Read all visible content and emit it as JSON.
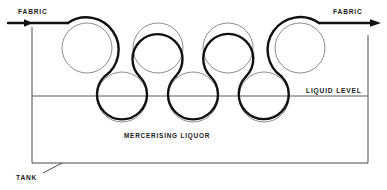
{
  "diagram": {
    "type": "process-schematic",
    "canvas": {
      "width": 387,
      "height": 190,
      "background": "#ffffff"
    },
    "colors": {
      "fabric_path": "#111111",
      "roller_outline": "#8d8d8d",
      "tank_outline": "#4a4a4a",
      "liquid_level": "#5a5a5a",
      "text": "#1a1a1a"
    },
    "labels": {
      "fabric_in": "FABRIC",
      "fabric_out": "FABRIC",
      "liquid_level": "LIQUID  LEVEL",
      "liquor": "MERCERISING   LIQUOR",
      "tank": "TANK"
    },
    "tank": {
      "left": 32,
      "right": 368,
      "top_left_y": 27,
      "top_right_y": 35,
      "bottom": 163
    },
    "liquid_level": {
      "y": 96,
      "x_start": 32,
      "x_end": 368
    },
    "fabric_line": {
      "entry_y": 23,
      "exit_y": 23,
      "arrow_in_x_start": 8,
      "arrow_in_x_end": 30,
      "arrow_out_x_start": 330,
      "arrow_out_x_end": 380
    },
    "rollers": {
      "radius": 25,
      "top": [
        {
          "id": "top-roller-1",
          "cx": 87,
          "cy": 48
        },
        {
          "id": "top-roller-2",
          "cx": 158,
          "cy": 48
        },
        {
          "id": "top-roller-3",
          "cx": 228,
          "cy": 48
        },
        {
          "id": "top-roller-4",
          "cx": 300,
          "cy": 48
        }
      ],
      "bottom": [
        {
          "id": "bottom-roller-1",
          "cx": 122,
          "cy": 97
        },
        {
          "id": "bottom-roller-2",
          "cx": 193,
          "cy": 97
        },
        {
          "id": "bottom-roller-3",
          "cx": 264,
          "cy": 97
        }
      ]
    },
    "tank_leader": {
      "x1": 43,
      "y1": 173,
      "x2": 62,
      "y2": 163
    }
  }
}
